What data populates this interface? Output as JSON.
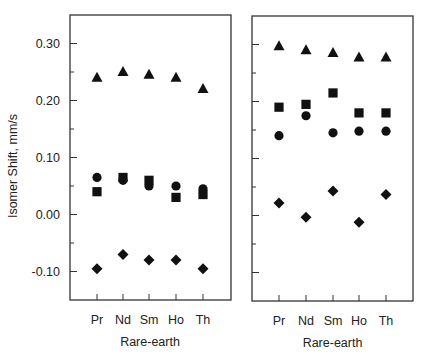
{
  "chart_data": [
    {
      "type": "scatter",
      "panel": "left",
      "title": "",
      "xlabel": "Rare-earth",
      "ylabel": "Isomer Shift, mm/s",
      "categories": [
        "Pr",
        "Nd",
        "Sm",
        "Ho",
        "Th"
      ],
      "ylim": [
        -0.15,
        0.35
      ],
      "yticks": [
        -0.1,
        0.0,
        0.1,
        0.2,
        0.3
      ],
      "ytick_labels": [
        "-0.10",
        "0.00",
        "0.10",
        "0.20",
        "0.30"
      ],
      "minor_ytick_step": 0.05,
      "grid": false,
      "legend": null,
      "series": [
        {
          "name": "triangle",
          "marker": "triangle",
          "values": [
            0.24,
            0.25,
            0.245,
            0.24,
            0.22
          ]
        },
        {
          "name": "square",
          "marker": "square",
          "values": [
            0.04,
            0.065,
            0.06,
            0.03,
            0.035
          ]
        },
        {
          "name": "circle",
          "marker": "circle",
          "values": [
            0.065,
            0.06,
            0.05,
            0.05,
            0.045
          ]
        },
        {
          "name": "diamond",
          "marker": "diamond",
          "values": [
            -0.095,
            -0.07,
            -0.08,
            -0.08,
            -0.095
          ]
        }
      ]
    },
    {
      "type": "scatter",
      "panel": "right",
      "title": "",
      "xlabel": "Rare-earth",
      "ylabel": "",
      "categories": [
        "Pr",
        "Nd",
        "Sm",
        "Ho",
        "Th"
      ],
      "ylim": [
        -0.15,
        0.35
      ],
      "yticks": [
        -0.1,
        0.0,
        0.1,
        0.2,
        0.3
      ],
      "ytick_labels": [],
      "minor_ytick_step": 0.05,
      "grid": false,
      "legend": null,
      "series": [
        {
          "name": "triangle",
          "marker": "triangle",
          "values": [
            0.297,
            0.29,
            0.285,
            0.277,
            0.277
          ]
        },
        {
          "name": "square",
          "marker": "square",
          "values": [
            0.19,
            0.195,
            0.215,
            0.18,
            0.18
          ]
        },
        {
          "name": "circle",
          "marker": "circle",
          "values": [
            0.14,
            0.175,
            0.145,
            0.148,
            0.148
          ]
        },
        {
          "name": "diamond",
          "marker": "diamond",
          "values": [
            0.022,
            -0.003,
            0.043,
            -0.012,
            0.037
          ]
        }
      ]
    }
  ],
  "colors": {
    "marker": "#111111",
    "axis": "#333333",
    "text": "#222222"
  }
}
